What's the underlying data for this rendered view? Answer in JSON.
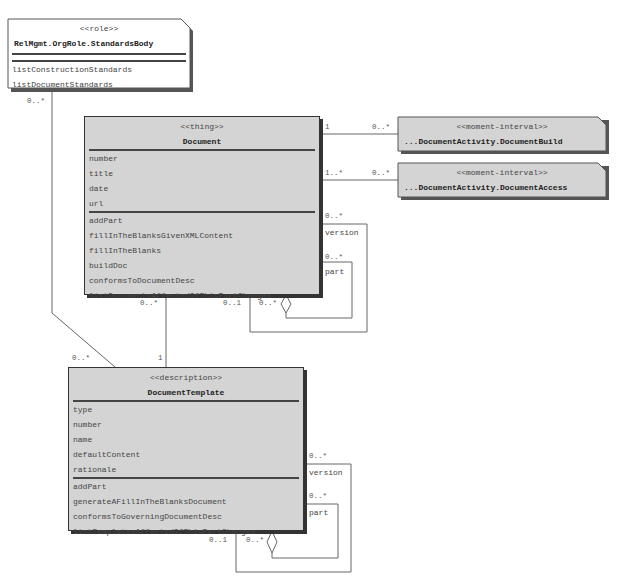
{
  "classes": {
    "standards_body": {
      "stereotype": "<<role>>",
      "name": "RelMgmt.OrgRole.StandardsBody",
      "attributes": [],
      "operations": [
        "listConstructionStandards",
        "listDocumentStandards"
      ]
    },
    "document": {
      "stereotype": "<<thing>>",
      "name": "Document",
      "attributes": [
        "number",
        "title",
        "date",
        "url"
      ],
      "operations": [
        "addPart",
        "fillInTheBlanksGivenXMLContent",
        "fillInTheBlanks",
        "buildDoc",
        "conformsToDocumentDesc",
        "listDocumentsAffectedIfThisPartChanges"
      ]
    },
    "document_build": {
      "stereotype": "<<moment-interval>>",
      "name": "...DocumentActivity.DocumentBuild"
    },
    "document_access": {
      "stereotype": "<<moment-interval>>",
      "name": "...DocumentActivity.DocumentAccess"
    },
    "document_template": {
      "stereotype": "<<description>>",
      "name": "DocumentTemplate",
      "attributes": [
        "type",
        "number",
        "name",
        "defaultContent",
        "rationale"
      ],
      "operations": [
        "addPart",
        "generateAFillInTheBlanksDocument",
        "conformsToGoverningDocumentDesc",
        "listTemplatesAffectedIfThisPartChanges"
      ]
    }
  },
  "associations": {
    "standards_to_template": {
      "source_mult": "0..*",
      "target_mult": "0..*"
    },
    "document_to_build": {
      "source_mult": "1",
      "target_mult": "0..*"
    },
    "document_to_access": {
      "source_mult": "1..*",
      "target_mult": "0..*"
    },
    "document_version": {
      "mult": "0..*",
      "role": "version"
    },
    "document_part": {
      "mult": "0..*",
      "role": "part",
      "whole_mult": "0..1",
      "part_mult": "0..*"
    },
    "document_to_template": {
      "source_mult": "0..*",
      "target_mult": "1"
    },
    "template_version": {
      "mult": "0..*",
      "role": "version"
    },
    "template_part": {
      "mult": "0..*",
      "role": "part",
      "whole_mult": "0..1",
      "part_mult": "0..*"
    }
  }
}
